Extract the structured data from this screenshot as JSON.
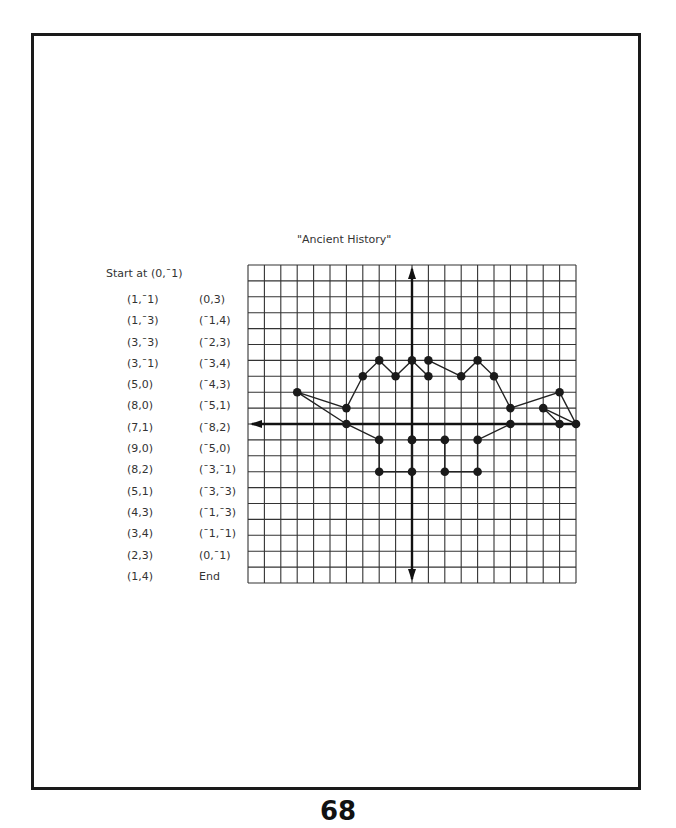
{
  "page": {
    "title": "\"Ancient History\"",
    "start_label": "Start at (0,¯1)",
    "page_number": "68"
  },
  "instructions": {
    "column_1": [
      "(1,¯1)",
      "(1,¯3)",
      "(3,¯3)",
      "(3,¯1)",
      "(5,0)",
      "(8,0)",
      "(7,1)",
      "(9,0)",
      "(8,2)",
      "(5,1)",
      "(4,3)",
      "(3,4)",
      "(2,3)",
      "(1,4)"
    ],
    "column_2": [
      "(0,3)",
      "(¯1,4)",
      "(¯2,3)",
      "(¯3,4)",
      "(¯4,3)",
      "(¯5,1)",
      "(¯8,2)",
      "(¯5,0)",
      "(¯3,¯1)",
      "(¯3,¯3)",
      "(¯1,¯3)",
      "(¯1,¯1)",
      "(0,¯1)",
      "End"
    ]
  },
  "grid": {
    "left": 248,
    "top": 265,
    "cols": 20,
    "rows": 20,
    "cell_w": 16.4,
    "cell_h": 15.9,
    "origin_col": 10,
    "origin_row": 10,
    "line_color": "#333333",
    "axis_color": "#111111"
  },
  "chart_data": {
    "type": "scatter",
    "title": "\"Ancient History\"",
    "xlabel": "",
    "ylabel": "",
    "grid": true,
    "xlim": [
      -10,
      10
    ],
    "ylim": [
      -10,
      10
    ],
    "path_coordinates_listed": [
      [
        0,
        -1
      ],
      [
        1,
        -1
      ],
      [
        1,
        -3
      ],
      [
        3,
        -3
      ],
      [
        3,
        -1
      ],
      [
        5,
        0
      ],
      [
        8,
        0
      ],
      [
        7,
        1
      ],
      [
        9,
        0
      ],
      [
        8,
        2
      ],
      [
        5,
        1
      ],
      [
        4,
        3
      ],
      [
        3,
        4
      ],
      [
        2,
        3
      ],
      [
        1,
        4
      ],
      [
        0,
        3
      ],
      [
        -1,
        4
      ],
      [
        -2,
        3
      ],
      [
        -3,
        4
      ],
      [
        -4,
        3
      ],
      [
        -5,
        1
      ],
      [
        -8,
        2
      ],
      [
        -5,
        0
      ],
      [
        -3,
        -1
      ],
      [
        -3,
        -3
      ],
      [
        -1,
        -3
      ],
      [
        -1,
        -1
      ],
      [
        0,
        -1
      ]
    ],
    "plotted_points_grid_units": [
      [
        0,
        -1
      ],
      [
        2,
        -1
      ],
      [
        2,
        -3
      ],
      [
        4,
        -3
      ],
      [
        4,
        -1
      ],
      [
        6,
        0
      ],
      [
        9,
        0
      ],
      [
        8,
        1
      ],
      [
        10,
        0
      ],
      [
        9,
        2
      ],
      [
        6,
        1
      ],
      [
        5,
        3
      ],
      [
        4,
        4
      ],
      [
        3,
        3
      ],
      [
        1,
        4
      ],
      [
        1,
        3
      ],
      [
        0,
        4
      ],
      [
        -1,
        3
      ],
      [
        -2,
        4
      ],
      [
        -3,
        3
      ],
      [
        -4,
        1
      ],
      [
        -7,
        2
      ],
      [
        -4,
        0
      ],
      [
        -2,
        -1
      ],
      [
        -2,
        -3
      ],
      [
        0,
        -3
      ],
      [
        0,
        -1
      ]
    ]
  }
}
